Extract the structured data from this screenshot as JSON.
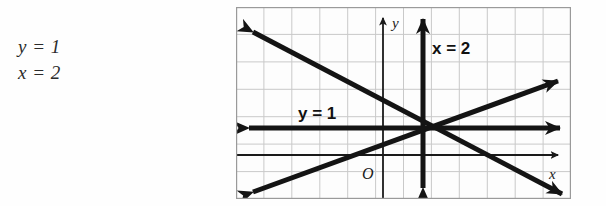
{
  "page": {
    "background_color": "#ffffff",
    "width": 606,
    "height": 206
  },
  "answer_block": {
    "name": "solution-equations",
    "lines": [
      {
        "text": "y = 1"
      },
      {
        "text": "x = 2"
      }
    ]
  },
  "graph": {
    "frame": {
      "x": 236,
      "y": 7,
      "width": 335,
      "height": 192,
      "border_color": "#9a9a9a",
      "background_color": "#fdfdfd"
    },
    "grid": {
      "visible": true,
      "color": "#c9c9c9",
      "columns": 12,
      "rows": 7,
      "cell_width": 27.9,
      "cell_height": 27.4
    },
    "axes": {
      "color": "#1a1a1a",
      "x_axis": {
        "label": "x",
        "pixel_y": 155,
        "arrow": "right"
      },
      "y_axis": {
        "label": "y",
        "pixel_x": 383,
        "arrow": "up"
      },
      "origin_label": "O"
    },
    "labels": [
      {
        "name": "label-y-equals-1",
        "text": "y = 1",
        "x": 298,
        "y": 113,
        "style": "bold"
      },
      {
        "name": "label-x-equals-2",
        "text": "x = 2",
        "x": 432,
        "y": 48,
        "style": "bold"
      },
      {
        "name": "label-axis-y",
        "text": "y",
        "x": 392,
        "y": 22,
        "style": "italic"
      },
      {
        "name": "label-axis-x",
        "text": "x",
        "x": 549,
        "y": 173,
        "style": "italic"
      },
      {
        "name": "label-origin",
        "text": "O",
        "x": 362,
        "y": 173,
        "style": "italic"
      }
    ],
    "lines": [
      {
        "name": "line-y-equals-1",
        "equation": "y = 1",
        "type": "horizontal",
        "color": "#141414",
        "thickness": 5,
        "pixel_y": 128,
        "arrows": "both"
      },
      {
        "name": "line-x-equals-2",
        "equation": "x = 2",
        "type": "vertical",
        "color": "#141414",
        "thickness": 5,
        "pixel_x": 423,
        "arrows": "both"
      },
      {
        "name": "line-descending",
        "type": "diagonal",
        "slope_sign": "negative",
        "color": "#141414",
        "thickness": 5,
        "from": {
          "x": 246,
          "y": 26
        },
        "to": {
          "x": 565,
          "y": 193
        },
        "arrows": "both"
      },
      {
        "name": "line-ascending",
        "type": "diagonal",
        "slope_sign": "positive",
        "color": "#141414",
        "thickness": 5,
        "from": {
          "x": 246,
          "y": 189
        },
        "to": {
          "x": 561,
          "y": 78
        },
        "arrows": "both"
      }
    ],
    "intersection_point": {
      "x": 423,
      "y": 128,
      "meaning": "x = 2, y = 1"
    }
  }
}
